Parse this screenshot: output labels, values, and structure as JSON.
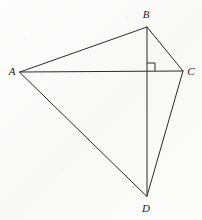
{
  "figure": {
    "name": "quadrilateral-abcd-with-diagonals",
    "caption": "",
    "background_color": "#fbfbfb",
    "stroke_color": "#2b2b2b",
    "label_color": "#1d1d1d",
    "stroke_width": 1,
    "canvas": {
      "width": 202,
      "height": 220
    }
  },
  "points": {
    "A": {
      "label": "A",
      "x": 20,
      "y": 72,
      "label_x": 12,
      "label_y": 71
    },
    "B": {
      "label": "B",
      "x": 147,
      "y": 27,
      "label_x": 146,
      "label_y": 14
    },
    "C": {
      "label": "C",
      "x": 183,
      "y": 71,
      "label_x": 191,
      "label_y": 71
    },
    "D": {
      "label": "D",
      "x": 147,
      "y": 196,
      "label_x": 146,
      "label_y": 208
    },
    "E": {
      "label": "",
      "x": 147,
      "y": 71,
      "label_x": 147,
      "label_y": 71
    }
  },
  "segments": [
    {
      "name": "segment-AB",
      "from": "A",
      "to": "B",
      "kind": "side"
    },
    {
      "name": "segment-BC",
      "from": "B",
      "to": "C",
      "kind": "side"
    },
    {
      "name": "segment-CD",
      "from": "C",
      "to": "D",
      "kind": "side"
    },
    {
      "name": "segment-DA",
      "from": "D",
      "to": "A",
      "kind": "side"
    },
    {
      "name": "segment-AC",
      "from": "A",
      "to": "C",
      "kind": "diagonal"
    },
    {
      "name": "segment-BD",
      "from": "B",
      "to": "D",
      "kind": "diagonal"
    }
  ],
  "right_angle": {
    "name": "right-angle-mark",
    "at": "E",
    "vertex_x": 147,
    "vertex_y": 71,
    "size": 8,
    "opens": "up-right",
    "path": "M 147 63 L 155 63 L 155 71"
  },
  "geometry_paths": {
    "outline": "M 20 72 L 147 27 L 183 71 L 147 196 Z",
    "diagonal_ac": "M 20 72 L 183 71",
    "diagonal_bd": "M 147 27 L 147 196"
  }
}
